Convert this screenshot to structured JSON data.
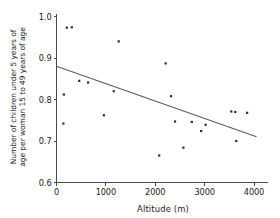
{
  "chart_data": {
    "type": "scatter",
    "title": "",
    "xlabel": "Altitude (m)",
    "ylabel": "Number of children under 5 years of age per woman 15 to 49 years of age",
    "ylabel_line1": "Number of children under 5 years of",
    "ylabel_line2": "age per woman 15 to 49 years of age",
    "xlim": [
      0,
      4050
    ],
    "ylim": [
      0.6,
      1.0
    ],
    "xticks": [
      0,
      1000,
      2000,
      3000,
      4000
    ],
    "xtick_labels": [
      "0",
      "1000",
      "2000",
      "3000",
      "4000"
    ],
    "yticks": [
      0.6,
      0.7,
      0.8,
      0.9,
      1.0
    ],
    "ytick_labels": [
      "0.6",
      "0.7",
      "0.8",
      "0.9",
      "1.0"
    ],
    "grid": false,
    "legend": "none",
    "points": [
      {
        "x": 210,
        "y": 0.973
      },
      {
        "x": 310,
        "y": 0.974
      },
      {
        "x": 150,
        "y": 0.812
      },
      {
        "x": 140,
        "y": 0.742
      },
      {
        "x": 460,
        "y": 0.845
      },
      {
        "x": 640,
        "y": 0.841
      },
      {
        "x": 960,
        "y": 0.762
      },
      {
        "x": 1160,
        "y": 0.82
      },
      {
        "x": 1260,
        "y": 0.94
      },
      {
        "x": 2080,
        "y": 0.665
      },
      {
        "x": 2210,
        "y": 0.887
      },
      {
        "x": 2320,
        "y": 0.808
      },
      {
        "x": 2400,
        "y": 0.747
      },
      {
        "x": 2570,
        "y": 0.684
      },
      {
        "x": 2740,
        "y": 0.746
      },
      {
        "x": 2930,
        "y": 0.724
      },
      {
        "x": 3020,
        "y": 0.739
      },
      {
        "x": 3540,
        "y": 0.771
      },
      {
        "x": 3620,
        "y": 0.77
      },
      {
        "x": 3640,
        "y": 0.7
      },
      {
        "x": 3860,
        "y": 0.768
      }
    ],
    "fit_line": {
      "type": "linear-regression",
      "x_start": 0,
      "y_start": 0.88,
      "x_end": 4050,
      "y_end": 0.71
    },
    "colors": {
      "point": "#2b2b2b",
      "line": "#5a5a5a",
      "axis": "#4a4a4a",
      "background": "#ffffff"
    }
  }
}
